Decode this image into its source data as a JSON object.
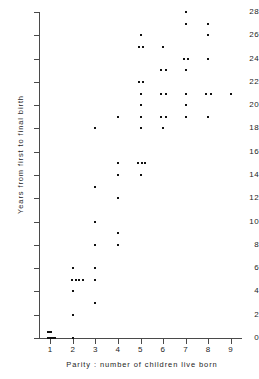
{
  "chart_data": {
    "type": "scatter",
    "title": "",
    "xlabel": "Parity : number of children live born",
    "ylabel": "Years from first to final birth",
    "xlim": [
      0.5,
      9.5
    ],
    "ylim": [
      0,
      28
    ],
    "grid": false,
    "legend": "none",
    "x_ticks": [
      "1",
      "2",
      "3",
      "4",
      "5",
      "6",
      "7",
      "8",
      "9"
    ],
    "y_ticks": [
      "0",
      "2",
      "4",
      "6",
      "8",
      "10",
      "12",
      "14",
      "16",
      "18",
      "20",
      "22",
      "24",
      "26",
      "28"
    ],
    "marker": "square-dot",
    "marker_color": "#111111",
    "axis_color": "#4a4a4a",
    "note": "Points at identical (x,y) are jittered horizontally to show ties.",
    "points": [
      {
        "x": 1,
        "y": 0,
        "jitter": -0.09
      },
      {
        "x": 1,
        "y": 0,
        "jitter": -0.02
      },
      {
        "x": 1,
        "y": 0,
        "jitter": 0.05
      },
      {
        "x": 1,
        "y": 0,
        "jitter": 0.13
      },
      {
        "x": 1,
        "y": 0,
        "jitter": 0.21
      },
      {
        "x": 1,
        "y": 0.55,
        "jitter": -0.09
      },
      {
        "x": 1,
        "y": 0.55,
        "jitter": -0.02
      },
      {
        "x": 1,
        "y": 0.55,
        "jitter": 0.05
      },
      {
        "x": 2,
        "y": 0,
        "jitter": 0
      },
      {
        "x": 2,
        "y": 2,
        "jitter": 0
      },
      {
        "x": 2,
        "y": 4,
        "jitter": 0
      },
      {
        "x": 2,
        "y": 5,
        "jitter": -0.05
      },
      {
        "x": 2,
        "y": 5,
        "jitter": 0.12
      },
      {
        "x": 2,
        "y": 5,
        "jitter": 0.29
      },
      {
        "x": 2,
        "y": 5,
        "jitter": 0.46
      },
      {
        "x": 2,
        "y": 6,
        "jitter": 0
      },
      {
        "x": 3,
        "y": 3,
        "jitter": 0
      },
      {
        "x": 3,
        "y": 5,
        "jitter": 0
      },
      {
        "x": 3,
        "y": 6,
        "jitter": 0
      },
      {
        "x": 3,
        "y": 8,
        "jitter": 0
      },
      {
        "x": 3,
        "y": 10,
        "jitter": 0
      },
      {
        "x": 3,
        "y": 13,
        "jitter": 0
      },
      {
        "x": 3,
        "y": 18,
        "jitter": 0
      },
      {
        "x": 4,
        "y": 8,
        "jitter": 0
      },
      {
        "x": 4,
        "y": 9,
        "jitter": 0
      },
      {
        "x": 4,
        "y": 12,
        "jitter": 0
      },
      {
        "x": 4,
        "y": 14,
        "jitter": 0
      },
      {
        "x": 4,
        "y": 15,
        "jitter": 0
      },
      {
        "x": 4,
        "y": 19,
        "jitter": 0
      },
      {
        "x": 5,
        "y": 14,
        "jitter": 0
      },
      {
        "x": 5,
        "y": 15,
        "jitter": -0.12
      },
      {
        "x": 5,
        "y": 15,
        "jitter": 0.05
      },
      {
        "x": 5,
        "y": 15,
        "jitter": 0.22
      },
      {
        "x": 5,
        "y": 18,
        "jitter": 0
      },
      {
        "x": 5,
        "y": 19,
        "jitter": 0
      },
      {
        "x": 5,
        "y": 20,
        "jitter": 0
      },
      {
        "x": 5,
        "y": 21,
        "jitter": 0
      },
      {
        "x": 5,
        "y": 22,
        "jitter": -0.08
      },
      {
        "x": 5,
        "y": 22,
        "jitter": 0.12
      },
      {
        "x": 5,
        "y": 25,
        "jitter": -0.08
      },
      {
        "x": 5,
        "y": 25,
        "jitter": 0.12
      },
      {
        "x": 5,
        "y": 26,
        "jitter": 0
      },
      {
        "x": 6,
        "y": 18,
        "jitter": 0
      },
      {
        "x": 6,
        "y": 19,
        "jitter": -0.08
      },
      {
        "x": 6,
        "y": 19,
        "jitter": 0.12
      },
      {
        "x": 6,
        "y": 21,
        "jitter": -0.08
      },
      {
        "x": 6,
        "y": 21,
        "jitter": 0.12
      },
      {
        "x": 6,
        "y": 23,
        "jitter": -0.08
      },
      {
        "x": 6,
        "y": 23,
        "jitter": 0.12
      },
      {
        "x": 6,
        "y": 25,
        "jitter": 0
      },
      {
        "x": 7,
        "y": 19,
        "jitter": 0
      },
      {
        "x": 7,
        "y": 20,
        "jitter": 0
      },
      {
        "x": 7,
        "y": 21,
        "jitter": 0
      },
      {
        "x": 7,
        "y": 23,
        "jitter": 0
      },
      {
        "x": 7,
        "y": 24,
        "jitter": -0.08
      },
      {
        "x": 7,
        "y": 24,
        "jitter": 0.12
      },
      {
        "x": 7,
        "y": 27,
        "jitter": 0
      },
      {
        "x": 7,
        "y": 28,
        "jitter": 0
      },
      {
        "x": 8,
        "y": 19,
        "jitter": 0
      },
      {
        "x": 8,
        "y": 21,
        "jitter": -0.08
      },
      {
        "x": 8,
        "y": 21,
        "jitter": 0.12
      },
      {
        "x": 8,
        "y": 24,
        "jitter": 0
      },
      {
        "x": 8,
        "y": 26,
        "jitter": 0
      },
      {
        "x": 8,
        "y": 27,
        "jitter": 0
      },
      {
        "x": 9,
        "y": 21,
        "jitter": 0
      }
    ]
  }
}
